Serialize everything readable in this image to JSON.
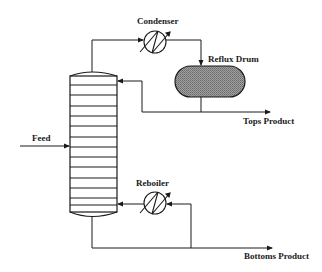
{
  "diagram": {
    "labels": {
      "condenser": "Condenser",
      "reflux_drum": "Reflux Drum",
      "tops_product": "Tops Product",
      "feed": "Feed",
      "reboiler": "Reboiler",
      "bottoms_product": "Bottoms Product"
    },
    "column": {
      "tray_count": 16
    },
    "colors": {
      "line": "#1a1a1a",
      "drum_fill": "#8a8a8a",
      "background": "#ffffff"
    }
  }
}
